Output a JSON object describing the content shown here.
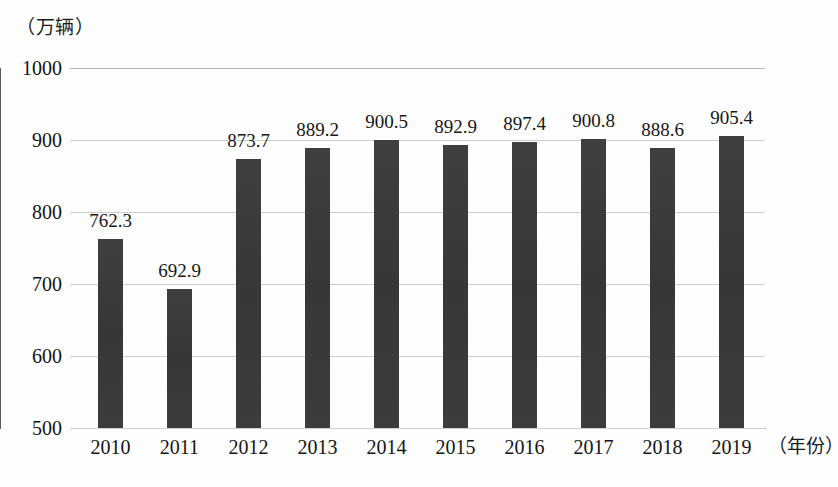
{
  "chart_data": {
    "type": "bar",
    "title": "",
    "subtitle": "",
    "unit_caption": "（万辆）",
    "xlabel": "（年份）",
    "ylabel": "",
    "categories": [
      "2010",
      "2011",
      "2012",
      "2013",
      "2014",
      "2015",
      "2016",
      "2017",
      "2018",
      "2019"
    ],
    "values": [
      762.3,
      692.9,
      873.7,
      889.2,
      900.5,
      892.9,
      897.4,
      900.8,
      888.6,
      905.4
    ],
    "value_labels": [
      "762.3",
      "692.9",
      "873.7",
      "889.2",
      "900.5",
      "892.9",
      "897.4",
      "900.8",
      "888.6",
      "905.4"
    ],
    "ylim": [
      500,
      1000
    ],
    "yticks": [
      1000,
      900,
      800,
      700,
      600,
      500
    ],
    "ytick_labels": [
      "1000",
      "900",
      "800",
      "700",
      "600",
      "500"
    ],
    "grid": true,
    "grid_axis": "y",
    "legend": null,
    "legend_position": "none",
    "series": [
      {
        "name": "",
        "values": [
          762.3,
          692.9,
          873.7,
          889.2,
          900.5,
          892.9,
          897.4,
          900.8,
          888.6,
          905.4
        ]
      }
    ]
  },
  "colors": {
    "bar": "#3b3b3b",
    "gridline": "#cdcdcd",
    "axis": "#5d5d5d",
    "background": "#fefefe",
    "text": "#141414"
  }
}
